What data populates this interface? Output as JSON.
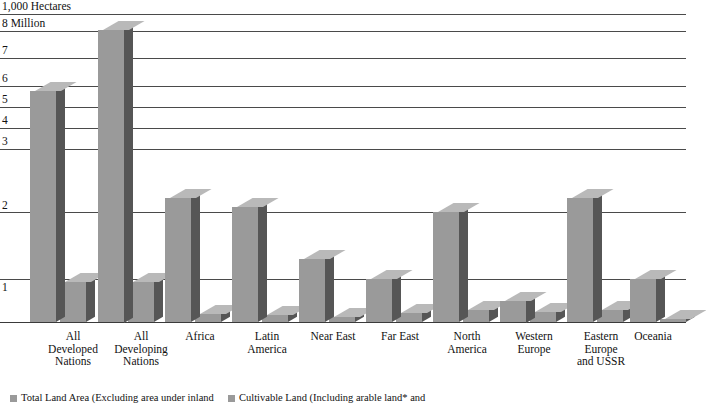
{
  "chart_data": {
    "type": "bar",
    "title": "",
    "xlabel": "",
    "ylabel": "1,000 Hectares",
    "unit_note": "8 Million",
    "ylim": [
      0,
      8.5
    ],
    "grid": true,
    "legend_position": "bottom-left",
    "categories": [
      "All Developed Nations",
      "All Developing Nations",
      "Africa",
      "Latin America",
      "Near East",
      "Far East",
      "North America",
      "Western Europe",
      "Eastern Europe and USSR",
      "Oceania"
    ],
    "series": [
      {
        "name": "Total Land Area (Excluding area under inland",
        "values": [
          6.0,
          8.05,
          2.45,
          2.15,
          1.3,
          1.0,
          2.0,
          0.5,
          2.45,
          1.0
        ]
      },
      {
        "name": "Cultivable Land (Including arable land* and",
        "values": [
          0.92,
          0.92,
          0.18,
          0.17,
          0.12,
          0.2,
          0.28,
          0.23,
          0.28,
          0.07
        ]
      }
    ],
    "y_ticks": [
      {
        "label": "8 Million",
        "value": 8
      },
      {
        "label": "7",
        "value": 7
      },
      {
        "label": "6",
        "value": 6
      },
      {
        "label": "5",
        "value": 5
      },
      {
        "label": "4",
        "value": 4
      },
      {
        "label": "3",
        "value": 3
      },
      {
        "label": "2",
        "value": 2
      },
      {
        "label": "1",
        "value": 1
      }
    ]
  },
  "axis": {
    "unit_caption": "1,000 Hectares",
    "ticks": {
      "t8": "8 Million",
      "t7": "7",
      "t6": "6",
      "t5": "5",
      "t4": "4",
      "t3": "3",
      "t2": "2",
      "t1": "1"
    }
  },
  "categories": {
    "c0_line1": "All",
    "c0_line2": "Developed",
    "c0_line3": "Nations",
    "c1_line1": "All",
    "c1_line2": "Developing",
    "c1_line3": "Nations",
    "c2_line1": "Africa",
    "c3_line1": "Latin",
    "c3_line2": "America",
    "c4_line1": "Near East",
    "c5_line1": "Far East",
    "c6_line1": "North",
    "c6_line2": "America",
    "c7_line1": "Western",
    "c7_line2": "Europe",
    "c8_line1": "Eastern",
    "c8_line2": "Europe",
    "c8_line3": "and USSR",
    "c9_line1": "Oceania"
  },
  "legend": {
    "entry1": "Total Land Area (Excluding area under inland",
    "entry2": "Cultivable Land (Including arable land* and"
  },
  "colors": {
    "bar_front": "#9a9a9a",
    "bar_side": "#565656",
    "bar_top": "#b9b9b9",
    "gridline": "#4a4a4a",
    "text": "#111111"
  }
}
